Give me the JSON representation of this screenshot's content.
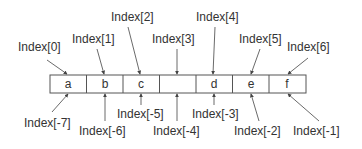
{
  "diagram": {
    "title": "",
    "colors": {
      "stroke": "#555555",
      "text": "#333333",
      "background": "#ffffff"
    },
    "cells": [
      "a",
      "b",
      "c",
      "",
      "d",
      "e",
      "f"
    ],
    "positive_labels": [
      "Index[0]",
      "Index[1]",
      "Index[2]",
      "Index[3]",
      "Index[4]",
      "Index[5]",
      "Index[6]"
    ],
    "negative_labels": [
      "Index[-7]",
      "Index[-6]",
      "Index[-5]",
      "Index[-4]",
      "Index[-3]",
      "Index[-2]",
      "Index[-1]"
    ]
  }
}
